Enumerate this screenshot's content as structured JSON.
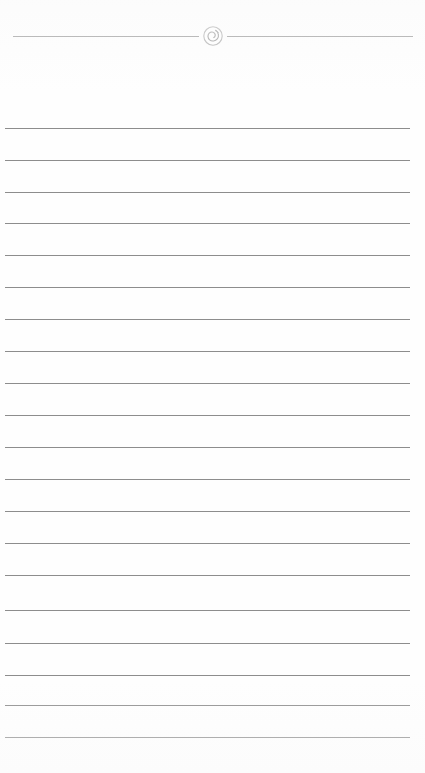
{
  "page": {
    "width": 425,
    "height": 773,
    "background_color": "#fefefe",
    "kind": "blank-ruled-page",
    "text_content": ""
  },
  "header": {
    "divider_y": 36,
    "rule_color": "#9b9b9b",
    "rule_thickness": 1,
    "left_rule": {
      "x_start": 6,
      "x_end": 192
    },
    "right_rule": {
      "x_start": 233,
      "x_end": 419
    },
    "ornament": {
      "icon_name": "spiral-scroll-ornament-icon",
      "shape": "circle-with-inner-spiral",
      "center_x": 200,
      "center_y": 36,
      "diameter": 20,
      "stroke_color": "#aeaeae",
      "inner_stroke_color": "#9c9c9c"
    }
  },
  "body": {
    "line_color": "#8d8d8d",
    "line_thickness": 1,
    "line_x_start": 5,
    "line_x_end": 410,
    "line_spacing": 32,
    "line_count": 20,
    "line_y_positions": [
      128,
      160,
      192,
      223,
      255,
      287,
      319,
      351,
      383,
      415,
      447,
      479,
      511,
      543,
      575,
      610,
      643,
      675,
      705,
      737
    ]
  },
  "chart_data": {
    "type": "table",
    "title": "",
    "categories": [],
    "values": []
  }
}
